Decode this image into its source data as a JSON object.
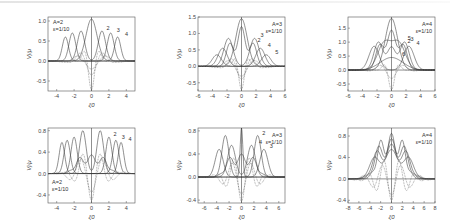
{
  "figure": {
    "panels_count": 6,
    "rows": 2,
    "cols": 3
  },
  "chart_data": [
    {
      "type": "line",
      "panel": "top-left",
      "title": "",
      "xlabel": "ξ0",
      "ylabel": "Vj/μ",
      "xlim": [
        -5,
        5
      ],
      "ylim": [
        -0.75,
        1.1
      ],
      "xticks": [
        -4,
        -2,
        0,
        2,
        4
      ],
      "yticks": [
        -0.5,
        0.0,
        0.5,
        1.0
      ],
      "ytick_labels": [
        "-0.5",
        "0.0",
        "0.5",
        "1.0"
      ],
      "annotation": [
        "A=2",
        "ε=1/10"
      ],
      "annotation_pos": "top-left",
      "curve_labels": [
        "1",
        "2",
        "3",
        "4"
      ],
      "series": [
        {
          "name": "1",
          "style": "solid",
          "kind": "gauss",
          "peaks": [
            [
              0,
              1.05,
              0.9
            ]
          ]
        },
        {
          "name": "2",
          "style": "solid",
          "kind": "gauss",
          "peaks": [
            [
              -1.2,
              0.75,
              0.6
            ],
            [
              1.2,
              0.75,
              0.6
            ]
          ]
        },
        {
          "name": "3",
          "style": "solid",
          "kind": "gauss",
          "peaks": [
            [
              -2.2,
              0.7,
              0.55
            ],
            [
              2.2,
              0.7,
              0.55
            ]
          ]
        },
        {
          "name": "4",
          "style": "solid",
          "kind": "gauss",
          "peaks": [
            [
              -3.0,
              0.6,
              0.5
            ],
            [
              3.0,
              0.6,
              0.5
            ]
          ]
        },
        {
          "name": "2b",
          "style": "dotted",
          "kind": "osc",
          "amp": -0.72,
          "freq": 3.0,
          "width": 0.9
        },
        {
          "name": "3b",
          "style": "dotted",
          "kind": "osc",
          "amp": -0.35,
          "freq": 2.2,
          "width": 1.8
        },
        {
          "name": "4b",
          "style": "dotted",
          "kind": "osc",
          "amp": -0.2,
          "freq": 1.8,
          "width": 2.4
        }
      ]
    },
    {
      "type": "line",
      "panel": "top-middle",
      "title": "",
      "xlabel": "ξ0",
      "ylabel": "Vj/μ",
      "xlim": [
        -6,
        6
      ],
      "ylim": [
        -0.75,
        1.5
      ],
      "xticks": [
        -6,
        -4,
        -2,
        0,
        2,
        4,
        6
      ],
      "yticks": [
        -0.5,
        0.0,
        0.5,
        1.0,
        1.5
      ],
      "ytick_labels": [
        "-0.5",
        "0.0",
        "0.5",
        "1.0",
        "1.5"
      ],
      "annotation": [
        "A=3",
        "ε=1/10"
      ],
      "annotation_pos": "top-right",
      "curve_labels": [
        "1",
        "2",
        "3",
        "4",
        "5"
      ],
      "series": [
        {
          "name": "1",
          "style": "solid",
          "kind": "gauss",
          "peaks": [
            [
              0,
              1.45,
              1.1
            ]
          ]
        },
        {
          "name": "2",
          "style": "solid",
          "kind": "gauss",
          "peaks": [
            [
              0,
              1.2,
              0.7
            ],
            [
              -1.6,
              0.7,
              0.7
            ],
            [
              1.6,
              0.7,
              0.7
            ]
          ]
        },
        {
          "name": "3",
          "style": "solid",
          "kind": "gauss",
          "peaks": [
            [
              -1.8,
              0.85,
              0.9
            ],
            [
              1.8,
              0.85,
              0.9
            ]
          ]
        },
        {
          "name": "4",
          "style": "solid",
          "kind": "gauss",
          "peaks": [
            [
              -2.6,
              0.55,
              0.9
            ],
            [
              2.6,
              0.55,
              0.9
            ]
          ]
        },
        {
          "name": "5",
          "style": "solid",
          "kind": "gauss",
          "peaks": [
            [
              -3.4,
              0.35,
              0.9
            ],
            [
              3.4,
              0.35,
              0.9
            ]
          ]
        },
        {
          "name": "2b",
          "style": "dotted",
          "kind": "osc",
          "amp": -0.7,
          "freq": 2.6,
          "width": 1.0
        },
        {
          "name": "3b",
          "style": "dotted",
          "kind": "osc",
          "amp": -0.4,
          "freq": 2.0,
          "width": 2.0
        },
        {
          "name": "4b",
          "style": "dotted",
          "kind": "osc",
          "amp": -0.3,
          "freq": 1.6,
          "width": 2.6
        }
      ]
    },
    {
      "type": "line",
      "panel": "top-right",
      "title": "",
      "xlabel": "ξ0",
      "ylabel": "Vj/μ",
      "xlim": [
        -6,
        6
      ],
      "ylim": [
        -0.75,
        1.9
      ],
      "xticks": [
        -6,
        -4,
        -2,
        0,
        2,
        4,
        6
      ],
      "yticks": [
        -0.5,
        0.0,
        0.5,
        1.0,
        1.5
      ],
      "ytick_labels": [
        "-0.5",
        "0.0",
        "0.5",
        "1.0",
        "1.5"
      ],
      "annotation": [
        "A=4",
        "ε=1/10"
      ],
      "annotation_pos": "top-right",
      "curve_labels": [
        "1",
        "2",
        "3",
        "4",
        "5",
        "6"
      ],
      "series": [
        {
          "name": "1",
          "style": "solid",
          "kind": "gauss",
          "peaks": [
            [
              0,
              1.85,
              1.2
            ]
          ]
        },
        {
          "name": "2",
          "style": "solid",
          "kind": "gauss",
          "peaks": [
            [
              0,
              1.4,
              0.8
            ],
            [
              -1.6,
              0.9,
              0.8
            ],
            [
              1.6,
              0.9,
              0.8
            ]
          ]
        },
        {
          "name": "3",
          "style": "solid",
          "kind": "gauss",
          "peaks": [
            [
              0,
              0.8,
              0.8
            ],
            [
              -1.8,
              1.0,
              0.9
            ],
            [
              1.8,
              1.0,
              0.9
            ]
          ]
        },
        {
          "name": "4",
          "style": "solid",
          "kind": "gauss",
          "peaks": [
            [
              -2.4,
              0.85,
              1.0
            ],
            [
              2.4,
              0.85,
              1.0
            ]
          ]
        },
        {
          "name": "5",
          "style": "solid",
          "kind": "gauss",
          "peaks": [
            [
              -1.0,
              0.95,
              1.3
            ],
            [
              1.0,
              0.95,
              1.3
            ]
          ]
        },
        {
          "name": "6",
          "style": "solid",
          "kind": "gauss",
          "peaks": [
            [
              0,
              0.45,
              2.2
            ]
          ]
        },
        {
          "name": "2b",
          "style": "dotted",
          "kind": "osc",
          "amp": -0.7,
          "freq": 2.4,
          "width": 1.0
        },
        {
          "name": "3b",
          "style": "dotted",
          "kind": "osc",
          "amp": -0.3,
          "freq": 1.8,
          "width": 2.2
        }
      ]
    },
    {
      "type": "line",
      "panel": "bottom-left",
      "title": "",
      "xlabel": "ξ0",
      "ylabel": "Vj/μ",
      "xlim": [
        -5,
        5
      ],
      "ylim": [
        -0.55,
        0.85
      ],
      "xticks": [
        -4,
        -2,
        0,
        2,
        4
      ],
      "yticks": [
        -0.4,
        0.0,
        0.4,
        0.8
      ],
      "ytick_labels": [
        "-0.4",
        "0.0",
        "0.4",
        "0.8"
      ],
      "annotation": [
        "A=2",
        "ε=1/10"
      ],
      "annotation_pos": "bottom-left",
      "curve_labels": [
        "1",
        "2",
        "3",
        "4"
      ],
      "series": [
        {
          "name": "1",
          "style": "solid",
          "kind": "gauss",
          "peaks": [
            [
              -1.0,
              0.8,
              0.55
            ],
            [
              1.0,
              0.8,
              0.55
            ]
          ]
        },
        {
          "name": "2",
          "style": "solid",
          "kind": "gauss",
          "peaks": [
            [
              -2.0,
              0.68,
              0.5
            ],
            [
              2.0,
              0.68,
              0.5
            ]
          ]
        },
        {
          "name": "3",
          "style": "solid",
          "kind": "gauss",
          "peaks": [
            [
              -2.8,
              0.62,
              0.5
            ],
            [
              2.8,
              0.62,
              0.5
            ]
          ]
        },
        {
          "name": "4",
          "style": "solid",
          "kind": "gauss",
          "peaks": [
            [
              -3.4,
              0.58,
              0.45
            ],
            [
              3.4,
              0.58,
              0.45
            ]
          ]
        },
        {
          "name": "1s",
          "style": "solid",
          "kind": "comb",
          "amp": 0.35,
          "freq": 4.5,
          "width": 2.2
        },
        {
          "name": "2b",
          "style": "dotted",
          "kind": "osc",
          "amp": -0.5,
          "freq": 3.0,
          "width": 1.8
        },
        {
          "name": "3b",
          "style": "dotted",
          "kind": "osc",
          "amp": -0.35,
          "freq": 2.4,
          "width": 2.4
        }
      ]
    },
    {
      "type": "line",
      "panel": "bottom-middle",
      "title": "",
      "xlabel": "ξ0",
      "ylabel": "Vj/μ",
      "xlim": [
        -7,
        7
      ],
      "ylim": [
        -0.45,
        0.85
      ],
      "xticks": [
        -6,
        -4,
        -2,
        0,
        2,
        4,
        6
      ],
      "yticks": [
        -0.4,
        0.0,
        0.4,
        0.8
      ],
      "ytick_labels": [
        "-0.4",
        "0.0",
        "0.4",
        "0.8"
      ],
      "annotation": [
        "A=3",
        "ε=1/10"
      ],
      "annotation_pos": "top-right",
      "curve_labels": [
        "1",
        "2",
        "3",
        "4",
        "5"
      ],
      "series": [
        {
          "name": "1",
          "style": "solid",
          "kind": "gauss",
          "peaks": [
            [
              0,
              0.85,
              0.3
            ]
          ]
        },
        {
          "name": "2",
          "style": "solid",
          "kind": "gauss",
          "peaks": [
            [
              -2.6,
              0.72,
              0.8
            ],
            [
              2.6,
              0.72,
              0.8
            ]
          ]
        },
        {
          "name": "3",
          "style": "solid",
          "kind": "gauss",
          "peaks": [
            [
              -3.6,
              0.48,
              0.9
            ],
            [
              3.6,
              0.48,
              0.9
            ]
          ]
        },
        {
          "name": "4",
          "style": "solid",
          "kind": "gauss",
          "peaks": [
            [
              -1.6,
              0.55,
              0.9
            ],
            [
              1.6,
              0.55,
              0.9
            ]
          ]
        },
        {
          "name": "5",
          "style": "solid",
          "kind": "comb",
          "amp": 0.4,
          "freq": 3.2,
          "width": 3.0
        },
        {
          "name": "2b",
          "style": "dotted",
          "kind": "osc",
          "amp": -0.42,
          "freq": 2.4,
          "width": 2.6
        },
        {
          "name": "3b",
          "style": "dotted",
          "kind": "osc",
          "amp": -0.3,
          "freq": 2.0,
          "width": 3.2
        }
      ]
    },
    {
      "type": "line",
      "panel": "bottom-right",
      "title": "",
      "xlabel": "ξ0",
      "ylabel": "Vj/μ",
      "xlim": [
        -8,
        8
      ],
      "ylim": [
        -0.45,
        0.95
      ],
      "xticks": [
        -8,
        -6,
        -4,
        -2,
        0,
        2,
        4,
        6,
        8
      ],
      "yticks": [
        -0.4,
        0.0,
        0.4,
        0.8
      ],
      "ytick_labels": [
        "-0.4",
        "0.0",
        "0.4",
        "0.8"
      ],
      "annotation": [
        "A=4",
        "ε=1/10"
      ],
      "annotation_pos": "top-right",
      "curve_labels": [
        "1",
        "2",
        "3",
        "4",
        "5"
      ],
      "series": [
        {
          "name": "1",
          "style": "solid",
          "kind": "comb",
          "amp": 0.85,
          "freq": 3.0,
          "width": 3.2
        },
        {
          "name": "2",
          "style": "solid",
          "kind": "comb",
          "amp": 0.75,
          "freq": 2.5,
          "width": 3.6
        },
        {
          "name": "3",
          "style": "solid",
          "kind": "comb",
          "amp": 0.65,
          "freq": 2.2,
          "width": 4.0
        },
        {
          "name": "4",
          "style": "solid",
          "kind": "comb",
          "amp": 0.55,
          "freq": 1.8,
          "width": 4.4
        },
        {
          "name": "2b",
          "style": "dotted",
          "kind": "osc",
          "amp": -0.4,
          "freq": 2.2,
          "width": 3.6
        },
        {
          "name": "3b",
          "style": "dotted",
          "kind": "osc",
          "amp": -0.3,
          "freq": 1.8,
          "width": 4.2
        }
      ]
    }
  ]
}
